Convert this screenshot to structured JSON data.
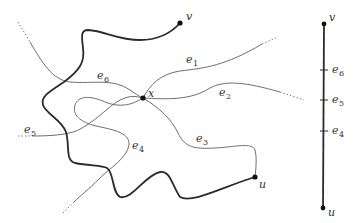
{
  "figure": {
    "colors": {
      "thick_path": "#2b2b2b",
      "thin_edge": "#6e6e6e",
      "vertex": "#111111",
      "label": "#333333"
    },
    "vertices": {
      "v": {
        "label": "v",
        "sub": ""
      },
      "u": {
        "label": "u",
        "sub": ""
      },
      "x": {
        "label": "x",
        "sub": ""
      }
    },
    "edges": [
      {
        "id": "e1",
        "label": "e",
        "sub": "1"
      },
      {
        "id": "e2",
        "label": "e",
        "sub": "2"
      },
      {
        "id": "e3",
        "label": "e",
        "sub": "3"
      },
      {
        "id": "e4",
        "label": "e",
        "sub": "4"
      },
      {
        "id": "e5",
        "label": "e",
        "sub": "5"
      },
      {
        "id": "e6",
        "label": "e",
        "sub": "6"
      }
    ],
    "straightened": {
      "top": {
        "label": "v"
      },
      "bottom": {
        "label": "u"
      },
      "ticks": [
        {
          "label": "e",
          "sub": "6"
        },
        {
          "label": "e",
          "sub": "5"
        },
        {
          "label": "e",
          "sub": "4"
        }
      ]
    }
  }
}
